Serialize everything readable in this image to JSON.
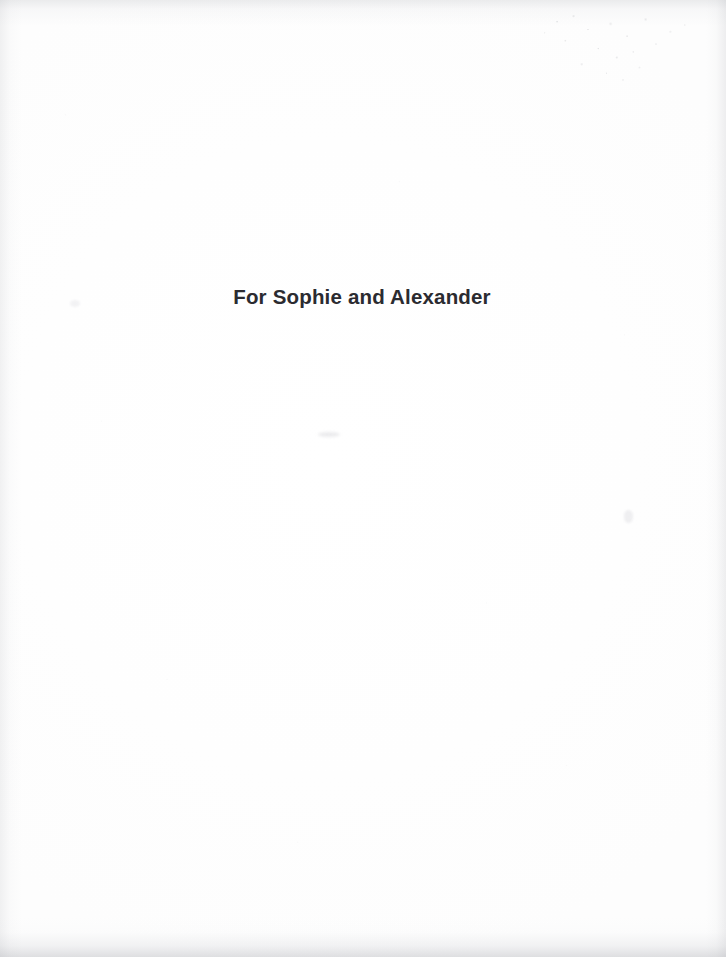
{
  "page": {
    "width": 726,
    "height": 957,
    "background_color": "#fefefe",
    "kind": "book-dedication-page"
  },
  "dedication": {
    "text": "For Sophie and Alexander",
    "color": "#2b2b30",
    "alignment": "center"
  },
  "artifacts": {
    "speckle_cloud_label": "scan-dust-speckles",
    "edge_shadow_label": "scan-edge-shadow",
    "smudge_label": "scan-smudge"
  }
}
